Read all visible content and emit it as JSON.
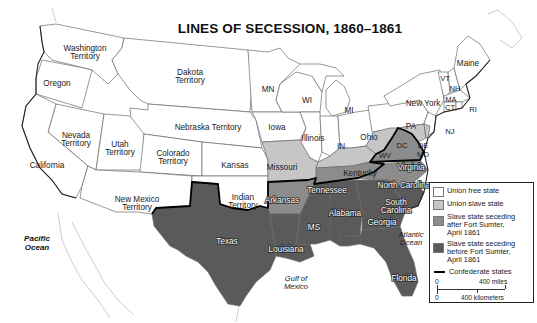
{
  "title": "LINES OF SECESSION, 1860–1861",
  "colors": {
    "union_free": "#ffffff",
    "union_slave": "#c6c6c6",
    "seceding_after": "#8c8c8c",
    "seceding_before": "#5a5a5a",
    "confederate_line": "#000000",
    "state_border": "#6a6a6a"
  },
  "labels": {
    "territories": {
      "washington": [
        "Washington",
        "Territory"
      ],
      "dakota": [
        "Dakota",
        "Territory"
      ],
      "nebraska": "Nebraska Territory",
      "nevada": [
        "Nevada",
        "Territory"
      ],
      "utah": [
        "Utah",
        "Territory"
      ],
      "colorado": [
        "Colorado",
        "Territory"
      ],
      "new_mexico": [
        "New Mexico",
        "Territory"
      ],
      "indian": [
        "Indian",
        "Territory"
      ]
    },
    "union_free": {
      "oregon": "Oregon",
      "california": "California",
      "kansas": "Kansas",
      "mn": "MN",
      "iowa": "Iowa",
      "wi": "WI",
      "mi": "MI",
      "illinois": "Illinois",
      "in": "IN",
      "ohio": "Ohio",
      "pa": "PA",
      "new_york": "New York",
      "vt": "VT",
      "nh": "NH",
      "maine": "Maine",
      "ma": "MA",
      "ct": "CT",
      "ri": "RI",
      "nj": "NJ"
    },
    "union_slave": {
      "missouri": "Missouri",
      "kentucky": "Kentucky",
      "wv": "WV",
      "de": "DE",
      "md": "MD",
      "dc": "DC"
    },
    "seceding_after": {
      "virginia": "Virginia",
      "north_carolina": "North Carolina",
      "tennessee": "Tennessee",
      "arkansas": "Arkansas"
    },
    "seceding_before": {
      "texas": "Texas",
      "louisiana": "Louisiana",
      "ms": "MS",
      "alabama": "Alabama",
      "georgia": "Georgia",
      "south_carolina": [
        "South",
        "Carolina"
      ],
      "florida": "Florida"
    },
    "water": {
      "pacific": [
        "Pacific",
        "Ocean"
      ],
      "atlantic": [
        "Atlantic",
        "Ocean"
      ],
      "gulf": [
        "Gulf of",
        "Mexico"
      ]
    }
  },
  "legend": {
    "items": [
      {
        "label": "Union free state",
        "color": "#ffffff"
      },
      {
        "label": "Union slave state",
        "color": "#c6c6c6"
      },
      {
        "label_lines": [
          "Slave state seceding",
          "after Fort Sumter,",
          "April 1861"
        ],
        "color": "#8c8c8c"
      },
      {
        "label_lines": [
          "Slave state seceding",
          "before Fort Sumter,",
          "April 1861"
        ],
        "color": "#5a5a5a"
      }
    ],
    "line_item": "Confederate states",
    "scale": {
      "zero_top": "0",
      "miles": "400 miles",
      "zero_bottom": "0",
      "km": "400 kilometers"
    }
  }
}
